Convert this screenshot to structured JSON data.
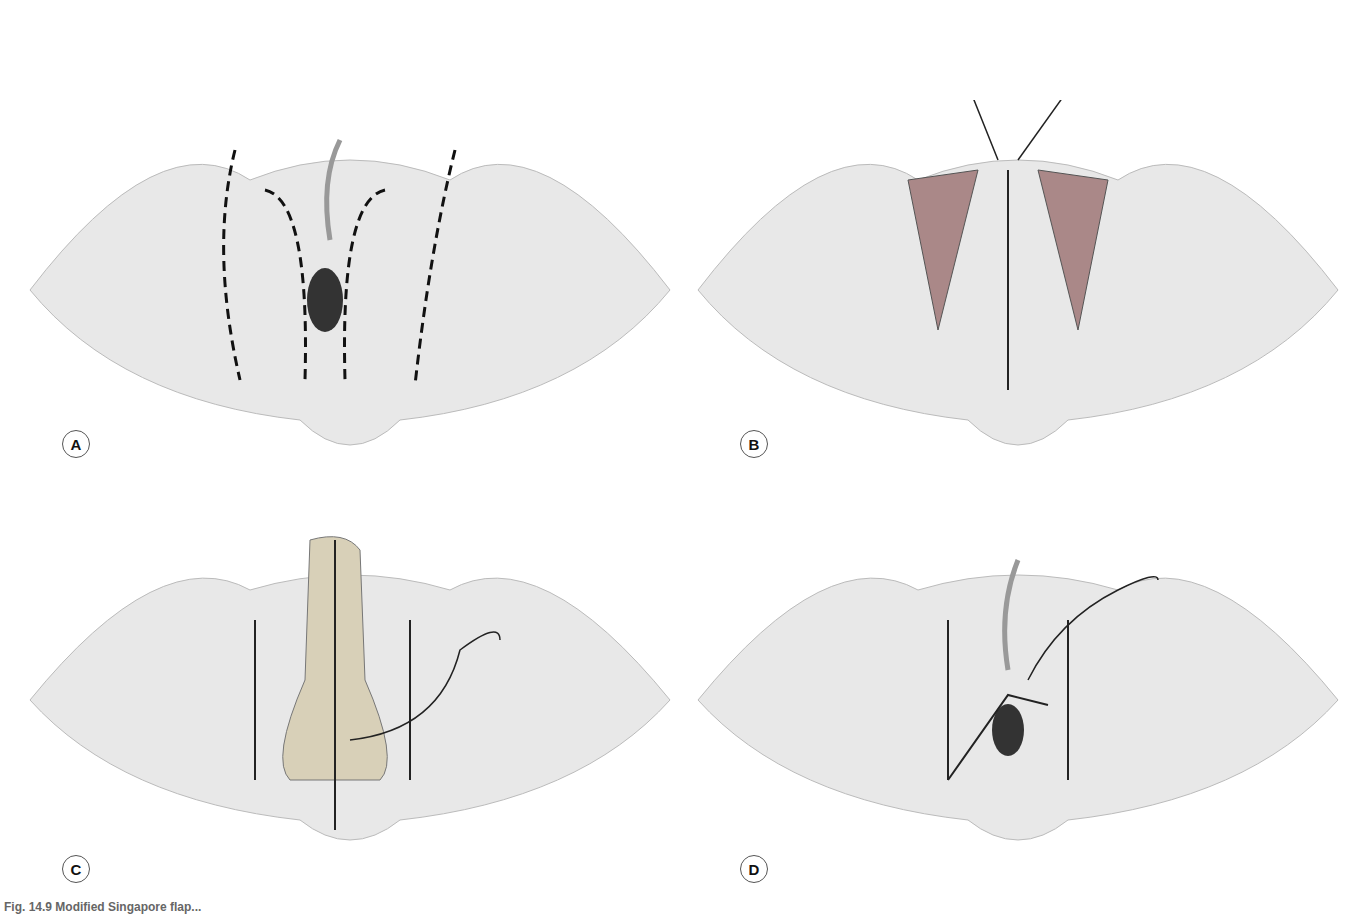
{
  "figure": {
    "panels": [
      {
        "id": "A",
        "label": "A",
        "description": "Outline of bilateral flap incisions (dashed lines) with catheter in place"
      },
      {
        "id": "B",
        "label": "B",
        "description": "Flaps raised; midline closure with retractors and suture"
      },
      {
        "id": "C",
        "label": "C",
        "description": "Flap rotated into position (arrows), lateral donor sites closed"
      },
      {
        "id": "D",
        "label": "D",
        "description": "Final inset with sutures and catheter"
      }
    ],
    "caption": "Fig. 14.9 Modified Singapore flap..."
  },
  "colors": {
    "skin_light": "#ececec",
    "skin_shadow": "#cfcfcf",
    "line": "#555555",
    "dash": "#111111"
  }
}
